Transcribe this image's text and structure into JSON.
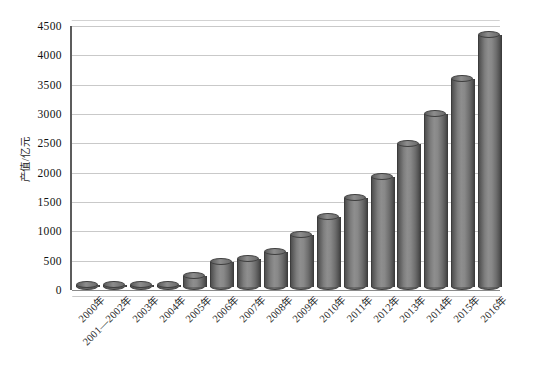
{
  "chart_data": {
    "type": "bar",
    "title": "",
    "subtitle": "",
    "xlabel": "",
    "ylabel": "产值/亿元",
    "ylim": [
      0,
      4500
    ],
    "ytick_step": 500,
    "yticks": [
      "0",
      "500",
      "1000",
      "1500",
      "2000",
      "2500",
      "3000",
      "3500",
      "4000",
      "4500"
    ],
    "grid": true,
    "legend": false,
    "legend_position": "none",
    "bar_style": "3d-cylinder",
    "bar_color": "#808080",
    "categories": [
      "2000年",
      "2001—2002年",
      "2003年",
      "2004年",
      "2005年",
      "2006年",
      "2007年",
      "2008年",
      "2009年",
      "2010年",
      "2011年",
      "2012年",
      "2013年",
      "2014年",
      "2015年",
      "2016年"
    ],
    "values": [
      20,
      25,
      30,
      40,
      190,
      420,
      470,
      600,
      880,
      1200,
      1520,
      1880,
      2430,
      2950,
      3550,
      4300
    ],
    "series": [
      {
        "name": "产值",
        "values": [
          20,
          25,
          30,
          40,
          190,
          420,
          470,
          600,
          880,
          1200,
          1520,
          1880,
          2430,
          2950,
          3550,
          4300
        ]
      }
    ]
  },
  "colors": {
    "background": "#ffffff",
    "bar_fill": "#808080",
    "bar_edge": "#3f3f3f",
    "gridline": "#c9c9c9",
    "axis": "#5c5c5c",
    "text": "#1a1a1a"
  }
}
